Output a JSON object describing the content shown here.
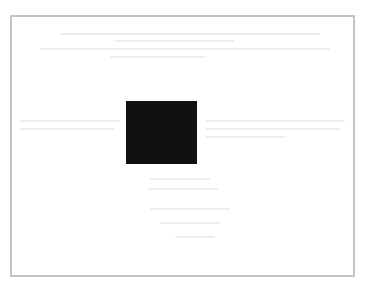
{
  "page": {
    "background": "#ffffff"
  },
  "frame": {
    "border_color": "#c4c4c4",
    "x": 10,
    "y": 15,
    "width": 345,
    "height": 262
  },
  "redaction_block": {
    "color": "#111111",
    "x": 126,
    "y": 101,
    "width": 71,
    "height": 63
  },
  "bleed_through_text": {
    "legible": false,
    "color": "#ececec",
    "lines": [
      {
        "x": 60,
        "y": 33,
        "w": 260
      },
      {
        "x": 115,
        "y": 40,
        "w": 120
      },
      {
        "x": 40,
        "y": 48,
        "w": 290
      },
      {
        "x": 110,
        "y": 56,
        "w": 95
      },
      {
        "x": 20,
        "y": 120,
        "w": 100
      },
      {
        "x": 205,
        "y": 120,
        "w": 140
      },
      {
        "x": 20,
        "y": 128,
        "w": 95
      },
      {
        "x": 205,
        "y": 128,
        "w": 135
      },
      {
        "x": 205,
        "y": 136,
        "w": 80
      },
      {
        "x": 150,
        "y": 178,
        "w": 60
      },
      {
        "x": 148,
        "y": 188,
        "w": 70
      },
      {
        "x": 150,
        "y": 208,
        "w": 80
      },
      {
        "x": 160,
        "y": 222,
        "w": 60
      },
      {
        "x": 175,
        "y": 236,
        "w": 40
      }
    ]
  }
}
